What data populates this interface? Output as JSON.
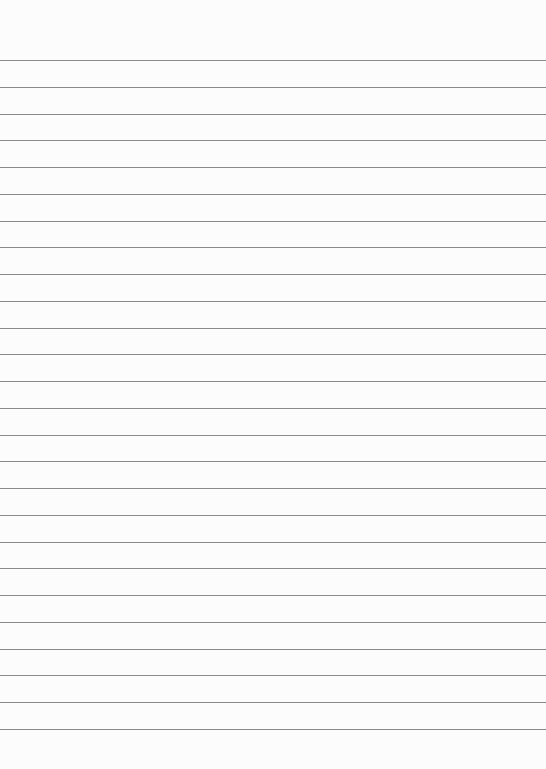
{
  "page": {
    "type": "lined-paper",
    "background_color": "#fcfcfc",
    "line_color": "#8a8a8a",
    "line_count": 26,
    "first_line_y": 60,
    "line_spacing": 26.76
  }
}
